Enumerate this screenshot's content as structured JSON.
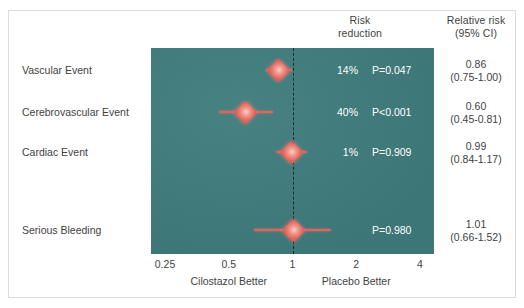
{
  "headers": {
    "risk_reduction_line1": "Risk",
    "risk_reduction_line2": "reduction",
    "relative_risk_line1": "Relative risk",
    "relative_risk_line2": "(95% CI)"
  },
  "axis": {
    "ticks": [
      "0.25",
      "0.5",
      "1",
      "2",
      "4"
    ],
    "left_caption": "Cilostazol Better",
    "right_caption": "Placebo Better"
  },
  "rows": [
    {
      "label": "Vascular Event",
      "risk_reduction": "14%",
      "p_value": "P=0.047",
      "relative_risk": "0.86",
      "ci_text": "(0.75-1.00)"
    },
    {
      "label": "Cerebrovascular Event",
      "risk_reduction": "40%",
      "p_value": "P<0.001",
      "relative_risk": "0.60",
      "ci_text": "(0.45-0.81)"
    },
    {
      "label": "Cardiac Event",
      "risk_reduction": "1%",
      "p_value": "P=0.909",
      "relative_risk": "0.99",
      "ci_text": "(0.84-1.17)"
    },
    {
      "label": "Serious Bleeding",
      "risk_reduction": "",
      "p_value": "P=0.980",
      "relative_risk": "1.01",
      "ci_text": "(0.66-1.52)"
    }
  ],
  "colors": {
    "panel_background": "#3f7c7c",
    "marker": "#e2655c",
    "marker_highlight": "#f7cfc8",
    "null_line": "#1d2b2b",
    "text_dark": "#3f3f3f",
    "text_light": "#ffffff",
    "frame_border": "#d8dcdc"
  },
  "chart_data": {
    "type": "scatter",
    "title": "",
    "subtitle": "",
    "xlabel": "Relative risk",
    "ylabel": "",
    "xscale": "log",
    "xlim": [
      0.25,
      4
    ],
    "xticks": [
      0.25,
      0.5,
      1,
      2,
      4
    ],
    "xticklabels": [
      "0.25",
      "0.5",
      "1",
      "2",
      "4"
    ],
    "grid": false,
    "legend": "none",
    "reference_line": 1,
    "annotations": [
      "Cilostazol Better",
      "Placebo Better"
    ],
    "categories": [
      "Vascular Event",
      "Cerebrovascular Event",
      "Cardiac Event",
      "Serious Bleeding"
    ],
    "series": [
      {
        "name": "Relative risk (95% CI)",
        "values": [
          0.86,
          0.6,
          0.99,
          1.01
        ],
        "ci_low": [
          0.75,
          0.45,
          0.84,
          0.66
        ],
        "ci_high": [
          1.0,
          0.81,
          1.17,
          1.52
        ],
        "risk_reduction_pct": [
          14,
          40,
          1,
          null
        ],
        "p_values": [
          "P=0.047",
          "P<0.001",
          "P=0.909",
          "P=0.980"
        ]
      }
    ]
  },
  "geometry": {
    "rows_y_center": [
      70,
      112,
      152,
      230
    ]
  }
}
